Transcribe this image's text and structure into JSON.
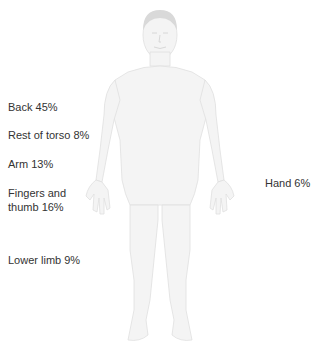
{
  "diagram": {
    "title": "",
    "figure": "human-body-front-view",
    "colors": {
      "body_fill": "#f3f3f3",
      "body_stroke": "#e2e2e2",
      "hair": "#d9d9d9",
      "text": "#333333"
    },
    "labels": [
      {
        "id": "back",
        "text": "Back 45%",
        "region": "Back",
        "percent": 45
      },
      {
        "id": "rest-of-torso",
        "text": "Rest of torso 8%",
        "region": "Rest of torso",
        "percent": 8
      },
      {
        "id": "arm",
        "text": "Arm 13%",
        "region": "Arm",
        "percent": 13
      },
      {
        "id": "fingers-thumb",
        "text_line1": "Fingers and",
        "text_line2": "thumb 16%",
        "region": "Fingers and thumb",
        "percent": 16
      },
      {
        "id": "lower-limb",
        "text": "Lower limb 9%",
        "region": "Lower limb",
        "percent": 9
      },
      {
        "id": "hand",
        "text": "Hand 6%",
        "region": "Hand",
        "percent": 6
      }
    ]
  }
}
